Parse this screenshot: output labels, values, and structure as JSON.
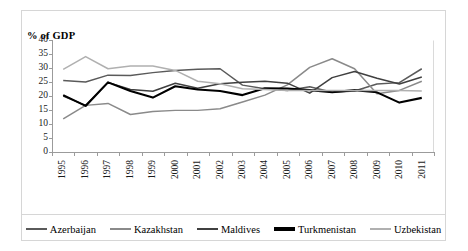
{
  "chart_data": {
    "type": "line",
    "title": "% of GDP",
    "xlabel": "",
    "ylabel": "% of GDP",
    "ylim": [
      0,
      40
    ],
    "ytick_step": 5,
    "yticks": [
      0,
      5,
      10,
      15,
      20,
      25,
      30,
      35,
      40
    ],
    "grid": false,
    "legend_position": "bottom",
    "categories": [
      "1995",
      "1996",
      "1997",
      "1998",
      "1999",
      "2000",
      "2001",
      "2002",
      "2003",
      "2004",
      "2005",
      "2006",
      "2007",
      "2008",
      "2009",
      "2010",
      "2011"
    ],
    "series": [
      {
        "name": "Azerbaijan",
        "color": "#5a5a5a",
        "values": [
          25.8,
          25.2,
          27.7,
          27.6,
          28.6,
          29.4,
          29.8,
          30.0,
          24.1,
          22.8,
          22.2,
          23.5,
          21.5,
          22.0,
          24.5,
          25.0,
          30.0
        ]
      },
      {
        "name": "Kazakhstan",
        "color": "#8a8a8a",
        "values": [
          11.9,
          16.8,
          17.5,
          13.5,
          14.6,
          15.0,
          15.0,
          15.6,
          18.0,
          20.5,
          24.2,
          30.5,
          33.6,
          30.0,
          21.0,
          22.2,
          25.5
        ]
      },
      {
        "name": "Maldives",
        "color": "#404040",
        "values": [
          20.2,
          16.8,
          25.1,
          22.5,
          21.9,
          24.8,
          23.0,
          24.6,
          25.1,
          25.5,
          24.8,
          21.2,
          26.8,
          29.0,
          26.6,
          24.5,
          27.0
        ]
      },
      {
        "name": "Turkmenistan",
        "color": "#000000",
        "values": [
          20.5,
          16.6,
          25.1,
          22.0,
          19.6,
          23.7,
          22.5,
          22.0,
          20.5,
          23.0,
          22.9,
          22.3,
          21.5,
          22.3,
          21.5,
          17.8,
          19.5
        ]
      },
      {
        "name": "Uzbekistan",
        "color": "#b0b0b0",
        "values": [
          29.8,
          34.4,
          30.0,
          31.0,
          31.0,
          29.4,
          25.5,
          24.6,
          22.8,
          22.5,
          22.2,
          22.2,
          22.2,
          22.2,
          22.2,
          22.2,
          22.0
        ]
      }
    ]
  },
  "legend": {
    "entries": [
      {
        "label": "Azerbaijan"
      },
      {
        "label": "Kazakhstan"
      },
      {
        "label": "Maldives"
      },
      {
        "label": "Turkmenistan"
      },
      {
        "label": "Uzbekistan"
      }
    ]
  }
}
